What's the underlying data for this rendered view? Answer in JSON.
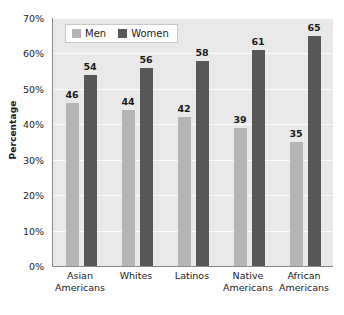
{
  "chart_data": {
    "type": "bar",
    "title": "",
    "xlabel": "",
    "ylabel": "Percentage",
    "ylim": [
      0,
      70
    ],
    "ytick_labels": [
      "70%",
      "60%",
      "50%",
      "40%",
      "30%",
      "20%",
      "10%",
      "0%"
    ],
    "ytick_values": [
      70,
      60,
      50,
      40,
      30,
      20,
      10,
      0
    ],
    "grid": true,
    "legend_position": "top-left-inside",
    "categories": [
      "Asian Americans",
      "Whites",
      "Latinos",
      "Native Americans",
      "African Americans"
    ],
    "category_lines": [
      [
        "Asian",
        "Americans"
      ],
      [
        "Whites"
      ],
      [
        "Latinos"
      ],
      [
        "Native",
        "Americans"
      ],
      [
        "African",
        "Americans"
      ]
    ],
    "series": [
      {
        "name": "Men",
        "color": "#b5b5b5",
        "values": [
          46,
          44,
          42,
          39,
          35
        ]
      },
      {
        "name": "Women",
        "color": "#575757",
        "values": [
          54,
          56,
          58,
          61,
          65
        ]
      }
    ]
  },
  "legend": {
    "entries": [
      {
        "label": "Men",
        "color": "#b5b5b5"
      },
      {
        "label": "Women",
        "color": "#575757"
      }
    ]
  },
  "colors": {
    "plot_background": "#e9e9e9",
    "gridline": "#fbfbfb",
    "axis_line": "#8a8a8a",
    "text": "#1c1c1c",
    "men_bar": "#b5b5b5",
    "women_bar": "#575757"
  }
}
